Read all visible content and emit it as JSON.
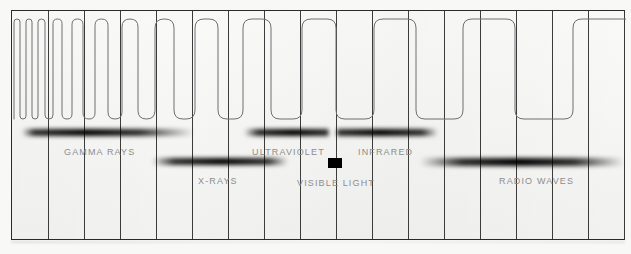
{
  "figure": {
    "background_color": "#f8f8f6",
    "panel_color": "#f4f4f2",
    "border_color": "#2b2b2b",
    "gridline_color": "#3c3c3c",
    "wave_stroke_color": "#6f6f72",
    "bar_color": "#000000",
    "label_color": "#8d8d8d"
  },
  "chart_data": {
    "type": "diagram",
    "xlabel": "",
    "ylabel": "",
    "grid": true,
    "legend_position": "none",
    "axis": {
      "orientation": "horizontal",
      "direction": "increasing wavelength to the right",
      "gridline_count": 17,
      "gridline_positions_px": [
        0,
        36,
        72,
        108,
        144,
        180,
        216,
        252,
        288,
        324,
        360,
        396,
        432,
        468,
        504,
        540,
        576,
        612
      ],
      "tick_labels": []
    },
    "wave": {
      "shape": "square wave with rounded caps",
      "top_y_px": 8,
      "bottom_y_px": 108,
      "amplitude_px": 100,
      "half_periods_px": [
        6,
        6,
        6,
        6,
        7,
        8,
        9,
        10,
        11,
        12,
        13,
        14,
        16,
        17,
        19,
        21,
        23,
        25,
        28,
        31,
        34,
        38,
        42,
        47,
        52,
        58,
        64,
        71,
        79
      ]
    },
    "bands": [
      {
        "name": "GAMMA RAYS",
        "row": 1,
        "bar": {
          "x": 10,
          "y": 118,
          "width": 172,
          "height": 7,
          "solid_from": 22,
          "solid_to": 128,
          "blur": true
        },
        "label": {
          "x": 52,
          "y": 136
        }
      },
      {
        "name": "X-RAYS",
        "row": 2,
        "bar": {
          "x": 140,
          "y": 147,
          "width": 136,
          "height": 7,
          "solid_from": 162,
          "solid_to": 256,
          "blur": true
        },
        "label": {
          "x": 186,
          "y": 165
        }
      },
      {
        "name": "ULTRAVIOLET",
        "row": 1,
        "bar": {
          "x": 232,
          "y": 118,
          "width": 85,
          "height": 7,
          "solid_from": 246,
          "solid_to": 316,
          "blur": true
        },
        "label": {
          "x": 240,
          "y": 136
        }
      },
      {
        "name": "VISIBLE LIGHT",
        "row": 2,
        "bar": {
          "x": 316,
          "y": 147,
          "width": 14,
          "height": 10,
          "solid_from": 316,
          "solid_to": 330,
          "blur": false
        },
        "label": {
          "x": 285,
          "y": 167
        }
      },
      {
        "name": "INFRARED",
        "row": 1,
        "bar": {
          "x": 324,
          "y": 118,
          "width": 102,
          "height": 7,
          "solid_from": 326,
          "solid_to": 410,
          "blur": true
        },
        "label": {
          "x": 346,
          "y": 136
        }
      },
      {
        "name": "RADIO WAVES",
        "row": 2,
        "bar": {
          "x": 408,
          "y": 147,
          "width": 204,
          "height": 8,
          "solid_from": 450,
          "solid_to": 562,
          "blur": true
        },
        "label": {
          "x": 487,
          "y": 165
        }
      }
    ]
  }
}
